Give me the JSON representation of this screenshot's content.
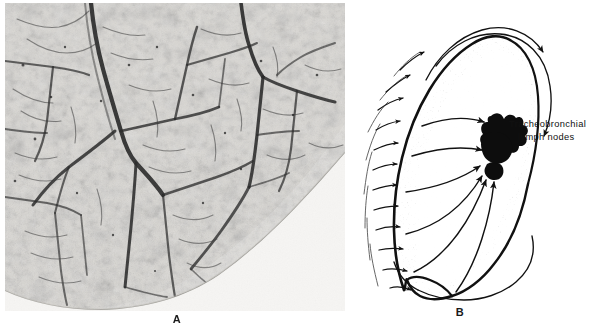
{
  "figure": {
    "type": "two-panel anatomical figure",
    "background_color": "#ffffff",
    "ink_color": "#111111"
  },
  "panel_a": {
    "caption": "A",
    "kind": "photomicrograph",
    "subject": "injected lung lymphatic vessels outlining pulmonary lobules",
    "tone": {
      "parenchyma": "#d8d6d2",
      "vessel_dark": "#2b2b2b",
      "vessel_mid": "#5a5a5a",
      "outside_margin": "#f4f3f1"
    },
    "notes": "Dark branching lymphatic channels form polygonal lobular networks; a large interlobular trunk runs from top centre downward; the rounded pleural lung margin crosses the lower right corner."
  },
  "panel_b": {
    "caption": "B",
    "kind": "line diagram",
    "subject": "direction of lymph flow in the lung toward the tracheobronchial lymph nodes",
    "label": {
      "line1": "Tracheobronchial",
      "line2": "lymph nodes"
    },
    "elements": [
      {
        "name": "lung-outline",
        "description": "lateral outline of lung with stippled pleural border"
      },
      {
        "name": "lymph-node-mass",
        "description": "solid black irregular cluster at the hilum"
      },
      {
        "name": "pleural-arrows",
        "description": "short arrows crossing the pleural surface, pointing inward"
      },
      {
        "name": "superficial-arcs",
        "description": "long curved arrows sweeping over the apex and around the base"
      },
      {
        "name": "deep-arrows",
        "description": "curved arrows converging from the periphery to the hilar nodes"
      }
    ],
    "arrow_counts": {
      "pleural_surface_arrows": 12,
      "converging_deep_arrows": 5,
      "apical_arc_arrows": 2
    }
  }
}
